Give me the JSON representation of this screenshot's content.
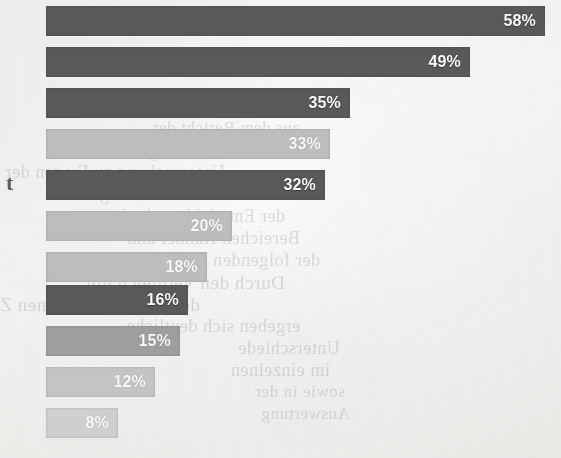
{
  "page": {
    "width": 561,
    "height": 458,
    "background_color": "#f3f2f0",
    "margin_glyph": "t"
  },
  "palette": {
    "dark_bar": "#595959",
    "light_bar": "#bdbdbd",
    "mid_bar": "#9e9e9e",
    "pale_bar": "#c4c4c4",
    "paler_bar": "#cfcfcf",
    "label_text": "#ffffff",
    "paper": "#f3f2f0"
  },
  "bleed_through": {
    "note": "faint mirrored show-through text from the reverse side of the scanned page",
    "lines": [
      {
        "text": "aus dem Bericht der",
        "x": 300,
        "y": 118,
        "size": 17
      },
      {
        "text": "uber die Ergebnisse der",
        "x": 250,
        "y": 140,
        "size": 19
      },
      {
        "text": "Untersuchung zu Fragen der",
        "x": 225,
        "y": 162,
        "size": 18
      },
      {
        "text": "wirtschaftlichen Lage und",
        "x": 260,
        "y": 184,
        "size": 18
      },
      {
        "text": "der Entwicklung in den",
        "x": 285,
        "y": 206,
        "size": 18
      },
      {
        "text": "Bereichen Handel und",
        "x": 300,
        "y": 228,
        "size": 18
      },
      {
        "text": "der folgenden Jahre",
        "x": 320,
        "y": 250,
        "size": 18
      },
      {
        "text": "Durch den Vergleich mit",
        "x": 285,
        "y": 272,
        "size": 19
      },
      {
        "text": "dem vorangegangenen Zeitraum",
        "x": 200,
        "y": 294,
        "size": 19
      },
      {
        "text": "ergeben sich deutliche",
        "x": 300,
        "y": 316,
        "size": 18
      },
      {
        "text": "Unterschiede",
        "x": 340,
        "y": 338,
        "size": 18
      },
      {
        "text": "im einzelnen",
        "x": 330,
        "y": 360,
        "size": 18
      },
      {
        "text": "sowie in der",
        "x": 345,
        "y": 382,
        "size": 17
      },
      {
        "text": "Auswertung",
        "x": 350,
        "y": 404,
        "size": 17
      }
    ]
  },
  "chart_data": {
    "type": "bar",
    "orientation": "horizontal",
    "title": "",
    "subtitle": "",
    "xlabel": "",
    "ylabel": "",
    "xlim": [
      0,
      58
    ],
    "grid": false,
    "legend": false,
    "value_suffix": "%",
    "categories": [
      "",
      "",
      "",
      "",
      "",
      "",
      "",
      "",
      "",
      "",
      ""
    ],
    "values": [
      58,
      49,
      35,
      33,
      32,
      20,
      18,
      16,
      15,
      12,
      8
    ],
    "labels": [
      "58%",
      "49%",
      "35%",
      "33%",
      "32%",
      "20%",
      "18%",
      "16%",
      "15%",
      "12%",
      "8%"
    ],
    "bar_colors": [
      "#595959",
      "#595959",
      "#595959",
      "#bdbdbd",
      "#595959",
      "#bdbdbd",
      "#bdbdbd",
      "#595959",
      "#9e9e9e",
      "#c4c4c4",
      "#cfcfcf"
    ],
    "label_is_dim": [
      false,
      false,
      false,
      true,
      false,
      true,
      true,
      false,
      true,
      true,
      true
    ],
    "geometry": {
      "left_px": 46,
      "bar_height_px": 30,
      "pitch_px": 41,
      "first_top_px": 6,
      "right_edges_px": [
        545,
        470,
        350,
        330,
        325,
        232,
        207,
        188,
        180,
        155,
        118
      ]
    },
    "bars": [
      {
        "value": 58,
        "label": "58%",
        "color": "#595959",
        "top": 6,
        "width": 499
      },
      {
        "value": 49,
        "label": "49%",
        "color": "#595959",
        "top": 47,
        "width": 424
      },
      {
        "value": 35,
        "label": "35%",
        "color": "#595959",
        "top": 88,
        "width": 304
      },
      {
        "value": 33,
        "label": "33%",
        "color": "#bdbdbd",
        "top": 129,
        "width": 284
      },
      {
        "value": 32,
        "label": "32%",
        "color": "#595959",
        "top": 170,
        "width": 279
      },
      {
        "value": 20,
        "label": "20%",
        "color": "#bdbdbd",
        "top": 211,
        "width": 186
      },
      {
        "value": 18,
        "label": "18%",
        "color": "#bdbdbd",
        "top": 252,
        "width": 161
      },
      {
        "value": 16,
        "label": "16%",
        "color": "#595959",
        "top": 285,
        "width": 142
      },
      {
        "value": 15,
        "label": "15%",
        "color": "#9e9e9e",
        "top": 326,
        "width": 134
      },
      {
        "value": 12,
        "label": "12%",
        "color": "#c4c4c4",
        "top": 367,
        "width": 109
      },
      {
        "value": 8,
        "label": "8%",
        "color": "#cfcfcf",
        "top": 408,
        "width": 72
      }
    ]
  }
}
